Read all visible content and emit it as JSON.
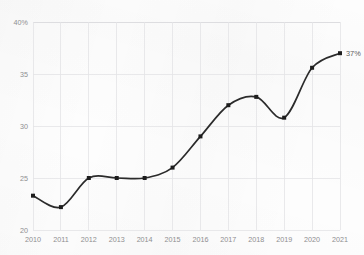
{
  "chart_data": {
    "type": "line",
    "title": "",
    "subtitle": "",
    "xlabel": "",
    "ylabel": "",
    "categories": [
      "2010",
      "2011",
      "2012",
      "2013",
      "2014",
      "2015",
      "2016",
      "2017",
      "2018",
      "2019",
      "2020",
      "2021"
    ],
    "x": [
      2010,
      2011,
      2012,
      2013,
      2014,
      2015,
      2016,
      2017,
      2018,
      2019,
      2020,
      2021
    ],
    "values": [
      23.3,
      22.2,
      25.0,
      25.0,
      25.0,
      26.0,
      29.0,
      32.0,
      32.8,
      30.8,
      35.6,
      37.0
    ],
    "series": [
      {
        "name": "",
        "values": [
          23.3,
          22.2,
          25.0,
          25.0,
          25.0,
          26.0,
          29.0,
          32.0,
          32.8,
          30.8,
          35.6,
          37.0
        ]
      }
    ],
    "ylim": [
      20,
      40
    ],
    "xlim": [
      2010,
      2021
    ],
    "ytick_labels": [
      "40%",
      "35",
      "30",
      "25",
      "20"
    ],
    "ytick_values": [
      40,
      35,
      30,
      25,
      20
    ],
    "xtick_labels": [
      "2010",
      "2011",
      "2012",
      "2013",
      "2014",
      "2015",
      "2016",
      "2017",
      "2018",
      "2019",
      "2020",
      "2021"
    ],
    "grid": true,
    "grid_axis": "both",
    "legend": false,
    "legend_position": "none",
    "markers": true,
    "annotations": [
      {
        "label": "37%",
        "x": 2021,
        "y": 37.0,
        "position": "right"
      }
    ],
    "colors": {
      "line": "#2b2b2b",
      "marker": "#1d1d1d",
      "grid": "#e3e3e6",
      "tick_text": "#8e8e90",
      "annotation_text": "#5b5b5d",
      "background": "#fdfdfd"
    }
  }
}
